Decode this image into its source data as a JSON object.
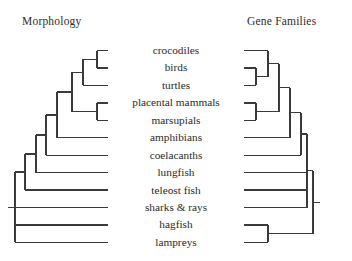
{
  "figure": {
    "type": "cladogram-comparison",
    "panels": [
      {
        "id": "morphology",
        "title": "Morphology",
        "title_x": 22,
        "root_side": "left"
      },
      {
        "id": "gene-families",
        "title": "Gene Families",
        "title_x": 247,
        "root_side": "right"
      }
    ]
  },
  "taxa": [
    {
      "index": 0,
      "label": "crocodiles"
    },
    {
      "index": 1,
      "label": "birds"
    },
    {
      "index": 2,
      "label": "turtles"
    },
    {
      "index": 3,
      "label": "placental mammals"
    },
    {
      "index": 4,
      "label": "marsupials"
    },
    {
      "index": 5,
      "label": "amphibians"
    },
    {
      "index": 6,
      "label": "coelacanths"
    },
    {
      "index": 7,
      "label": "lungfish"
    },
    {
      "index": 8,
      "label": "teleost fish"
    },
    {
      "index": 9,
      "label": "sharks & rays"
    },
    {
      "index": 10,
      "label": "hagfish"
    },
    {
      "index": 11,
      "label": "lampreys"
    }
  ],
  "style": {
    "line_color": "#3a3a3a",
    "line_width": 1.4,
    "background": "#ffffff",
    "text_color": "#2b2b2b",
    "row_start_y": 50.5,
    "row_spacing": 17.45
  },
  "chart_data": {
    "type": "cladogram",
    "title": "",
    "tip_labels": [
      "crocodiles",
      "birds",
      "turtles",
      "placental mammals",
      "marsupials",
      "amphibians",
      "coelacanths",
      "lungfish",
      "teleost fish",
      "sharks & rays",
      "hagfish",
      "lampreys"
    ],
    "trees": [
      {
        "name": "Morphology",
        "orientation": "tips-right-root-left",
        "newick": "(lampreys,(hagfish,((sharks & rays),((teleost fish),((lungfish),((coelacanths),((amphibians),(((placental mammals,marsupials)),((turtles),(crocodiles,birds))))))))));",
        "notes": "hagfish and lampreys are successive paraphyletic outgroups; crocodiles+birds are sisters, turtles sister to that pair",
        "tip_x": 108,
        "node_x": [
          97,
          83,
          72,
          57,
          46,
          36,
          25,
          15
        ],
        "root_stub_x": 8
      },
      {
        "name": "Gene Families",
        "orientation": "tips-left-root-right",
        "newick": "((hagfish,lampreys),((sharks & rays),((teleost fish),((lungfish),((coelacanths),((amphibians),((placental mammals,marsupials),(crocodiles,(birds,turtles)))))))));",
        "notes": "hagfish+lampreys form a monophyletic cyclostome clade; birds+turtles are sisters with crocodiles sister to that pair",
        "tip_x": 244,
        "node_x": [
          256,
          268,
          279,
          290,
          301,
          307
        ],
        "root_stub_x": 320
      }
    ],
    "key_differences": [
      "Cyclostomes (hagfish + lampreys) monophyletic in Gene Families, paraphyletic in Morphology",
      "Archosaur/turtle placement differs: crocodiles+birds sister in Morphology, birds+turtles sister in Gene Families"
    ]
  }
}
